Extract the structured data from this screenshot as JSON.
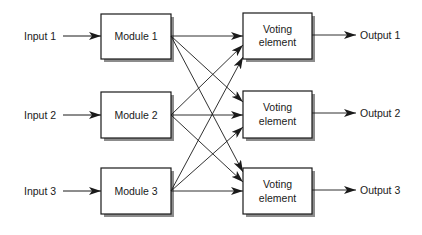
{
  "diagram": {
    "type": "N-modular redundancy (triple modular redundancy with triplicated voters)",
    "colors": {
      "line": "#1a1a1a",
      "box_fill": "#ffffff",
      "shadow": "#8c8c8c",
      "text": "#1a1a1a"
    },
    "inputs": [
      {
        "id": "input1",
        "label": "Input 1"
      },
      {
        "id": "input2",
        "label": "Input 2"
      },
      {
        "id": "input3",
        "label": "Input 3"
      }
    ],
    "modules": [
      {
        "id": "module1",
        "label": "Module 1"
      },
      {
        "id": "module2",
        "label": "Module 2"
      },
      {
        "id": "module3",
        "label": "Module 3"
      }
    ],
    "voters": [
      {
        "id": "voter1",
        "line1": "Voting",
        "line2": "element"
      },
      {
        "id": "voter2",
        "line1": "Voting",
        "line2": "element"
      },
      {
        "id": "voter3",
        "line1": "Voting",
        "line2": "element"
      }
    ],
    "outputs": [
      {
        "id": "output1",
        "label": "Output 1"
      },
      {
        "id": "output2",
        "label": "Output 2"
      },
      {
        "id": "output3",
        "label": "Output 3"
      }
    ],
    "edges": [
      {
        "from": "input1",
        "to": "module1"
      },
      {
        "from": "input2",
        "to": "module2"
      },
      {
        "from": "input3",
        "to": "module3"
      },
      {
        "from": "module1",
        "to": "voter1"
      },
      {
        "from": "module1",
        "to": "voter2"
      },
      {
        "from": "module1",
        "to": "voter3"
      },
      {
        "from": "module2",
        "to": "voter1"
      },
      {
        "from": "module2",
        "to": "voter2"
      },
      {
        "from": "module2",
        "to": "voter3"
      },
      {
        "from": "module3",
        "to": "voter1"
      },
      {
        "from": "module3",
        "to": "voter2"
      },
      {
        "from": "module3",
        "to": "voter3"
      },
      {
        "from": "voter1",
        "to": "output1"
      },
      {
        "from": "voter2",
        "to": "output2"
      },
      {
        "from": "voter3",
        "to": "output3"
      }
    ]
  }
}
